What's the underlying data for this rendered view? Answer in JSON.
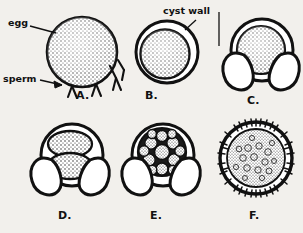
{
  "figure": {
    "title_text": "",
    "ink_color": "#111111",
    "paper_color": "#f2f0ec",
    "stipple_color": "#2a2a2a",
    "annotations": [
      {
        "name": "egg",
        "label": "egg",
        "x": 8,
        "y": 22,
        "target_x": 54,
        "target_y": 34
      },
      {
        "name": "sperm",
        "label": "sperm",
        "x": 4,
        "y": 74,
        "target_x": 62,
        "target_y": 82
      },
      {
        "name": "cyst-wall",
        "label": "cyst wall",
        "x": 163,
        "y": 7,
        "target_b_x": 181,
        "target_b_y": 28,
        "target_c_x": 218,
        "target_c_y": 48
      }
    ],
    "panels": [
      {
        "id": "A",
        "letter": "A.",
        "letter_x": 76,
        "letter_y": 96,
        "caption_meaning": "unfertilized egg surrounded by sperm",
        "cx": 82,
        "cy": 52,
        "r": 35,
        "cyst": false,
        "flaps": 0,
        "cells": 1,
        "cilia": false
      },
      {
        "id": "B",
        "letter": "B.",
        "letter_x": 145,
        "letter_y": 96,
        "caption_meaning": "fertilized egg enclosed by cyst wall",
        "cx": 167,
        "cy": 52,
        "r": 26,
        "cyst": true,
        "flaps": 0,
        "cells": 1,
        "cilia": false
      },
      {
        "id": "C",
        "letter": "C.",
        "letter_x": 247,
        "letter_y": 101,
        "caption_meaning": "cyst wall opening into flaps around egg",
        "cx": 262,
        "cy": 52,
        "r": 30,
        "cyst": true,
        "flaps": 2,
        "cells": 1,
        "cilia": false
      },
      {
        "id": "D",
        "letter": "D.",
        "letter_x": 58,
        "letter_y": 216,
        "caption_meaning": "two-cell cleavage stage inside opened cyst",
        "cx": 72,
        "cy": 157,
        "r": 30,
        "cyst": true,
        "flaps": 2,
        "cells": 2,
        "cilia": false
      },
      {
        "id": "E",
        "letter": "E.",
        "letter_x": 150,
        "letter_y": 216,
        "caption_meaning": "morula of many blastomeres inside opened cyst",
        "cx": 163,
        "cy": 157,
        "r": 30,
        "cyst": true,
        "flaps": 2,
        "cells": 12,
        "cilia": false
      },
      {
        "id": "F",
        "letter": "F.",
        "letter_x": 249,
        "letter_y": 216,
        "caption_meaning": "free-swimming ciliated larva",
        "cx": 256,
        "cy": 160,
        "r": 36,
        "cyst": false,
        "flaps": 0,
        "cells": 1,
        "cilia": true
      }
    ]
  }
}
